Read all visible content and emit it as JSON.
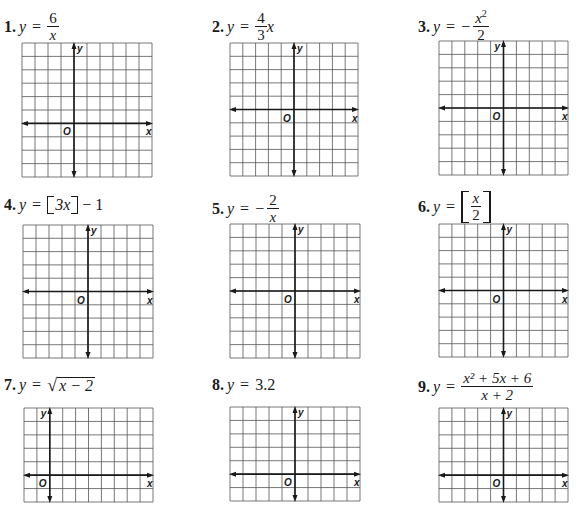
{
  "problems": [
    {
      "number": "1.",
      "equation": {
        "lhs": "y",
        "eq": "=",
        "numerator": "6",
        "denominator": "x"
      },
      "equation_text": "y = 6/x",
      "grid": {
        "left": 22,
        "top": 43,
        "width": 130,
        "height": 134,
        "cols": 10,
        "rows": 10,
        "yaxis_col": 4,
        "xaxis_row": 6,
        "y_label_side": "right"
      }
    },
    {
      "number": "2.",
      "equation": {
        "lhs": "y",
        "eq": "=",
        "numerator": "4",
        "denominator": "3",
        "suffix": "x"
      },
      "equation_text": "y = (4/3)x",
      "grid": {
        "left": 230,
        "top": 43,
        "width": 128,
        "height": 133,
        "cols": 10,
        "rows": 10,
        "yaxis_col": 5,
        "xaxis_row": 5,
        "y_label_side": "right"
      }
    },
    {
      "number": "3.",
      "equation": {
        "lhs": "y",
        "eq": "=",
        "sign": "−",
        "numerator": "x",
        "numerator_exp": "2",
        "denominator": "2"
      },
      "equation_text": "y = −x²/2",
      "grid": {
        "left": 439,
        "top": 41,
        "width": 129,
        "height": 134,
        "cols": 10,
        "rows": 10,
        "yaxis_col": 5,
        "xaxis_row": 5,
        "y_label_side": "left"
      }
    },
    {
      "number": "4.",
      "equation": {
        "lhs": "y",
        "eq": "=",
        "inner": "3x",
        "tail": "− 1"
      },
      "equation_text": "y = ⟦3x⟧ − 1",
      "grid": {
        "left": 23,
        "top": 225,
        "width": 130,
        "height": 133,
        "cols": 10,
        "rows": 10,
        "yaxis_col": 5,
        "xaxis_row": 5,
        "y_label_side": "right"
      }
    },
    {
      "number": "5.",
      "equation": {
        "lhs": "y",
        "eq": "=",
        "sign": "−",
        "numerator": "2",
        "denominator": "x"
      },
      "equation_text": "y = −2/x",
      "grid": {
        "left": 230,
        "top": 224,
        "width": 130,
        "height": 134,
        "cols": 10,
        "rows": 10,
        "yaxis_col": 5,
        "xaxis_row": 5,
        "y_label_side": "right"
      }
    },
    {
      "number": "6.",
      "equation": {
        "lhs": "y",
        "eq": "=",
        "numerator": "x",
        "denominator": "2"
      },
      "equation_text": "y = ⟦x/2⟧",
      "grid": {
        "left": 439,
        "top": 224,
        "width": 129,
        "height": 133,
        "cols": 10,
        "rows": 10,
        "yaxis_col": 5,
        "xaxis_row": 5,
        "y_label_side": "right"
      }
    },
    {
      "number": "7.",
      "equation": {
        "lhs": "y",
        "eq": "=",
        "radicand": "x − 2"
      },
      "equation_text": "y = √(x − 2)",
      "grid": {
        "left": 24,
        "top": 408,
        "width": 129,
        "height": 94,
        "cols": 10,
        "rows": 7,
        "yaxis_col": 2,
        "xaxis_row": 5,
        "y_label_side": "left"
      }
    },
    {
      "number": "8.",
      "equation": {
        "lhs": "y",
        "eq": "=",
        "rhs": "3.2"
      },
      "equation_text": "y = 3.2",
      "grid": {
        "left": 230,
        "top": 407,
        "width": 130,
        "height": 94,
        "cols": 10,
        "rows": 7,
        "yaxis_col": 5,
        "xaxis_row": 5,
        "y_label_side": "right"
      }
    },
    {
      "number": "9.",
      "equation": {
        "lhs": "y",
        "eq": "=",
        "numerator": "x² + 5x + 6",
        "denominator": "x + 2"
      },
      "equation_text": "y = (x² + 5x + 6)/(x + 2)",
      "grid": {
        "left": 439,
        "top": 408,
        "width": 129,
        "height": 94,
        "cols": 10,
        "rows": 7,
        "yaxis_col": 5,
        "xaxis_row": 5,
        "y_label_side": "right"
      }
    }
  ],
  "axis_labels": {
    "x": "x",
    "y": "y",
    "origin": "O"
  },
  "colors": {
    "ink": "#1a1a1a",
    "grid": "#555555",
    "paper": "#ffffff"
  }
}
